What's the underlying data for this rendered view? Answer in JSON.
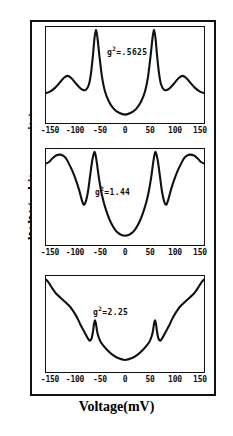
{
  "figure": {
    "ylabel": "dI/dV (arbitrary units)",
    "xlabel": "Voltage(mV)",
    "line_color": "#111111",
    "background_color": "#ffffff"
  },
  "chart_data": {
    "type": "line",
    "title": "",
    "xlabel": "Voltage(mV)",
    "ylabel": "dI/dV (arbitrary units)",
    "xlim": [
      -160,
      160
    ],
    "xticks": [
      -150,
      -100,
      -50,
      0,
      50,
      100,
      150
    ],
    "xticklabels": [
      "-150",
      "-100",
      "-50",
      "0",
      "50",
      "100",
      "150"
    ],
    "yticks": [],
    "yticklabels": [],
    "grid": false,
    "legend": null,
    "panel_layout": "3 stacked panels sharing x axis",
    "panels": [
      {
        "index": 0,
        "annotation": "g2 = .5625",
        "annotation_symbol": "g",
        "annotation_exponent": "2",
        "annotation_value": ".5625",
        "description": "two tall sharp peaks at about -60 and +60 mV reaching the top of the panel, small broad shoulders near -115 and +115 mV, deep flat-bottomed valley centered at 0 mV",
        "x": [
          -160,
          -150,
          -140,
          -130,
          -122,
          -115,
          -108,
          -100,
          -92,
          -85,
          -78,
          -72,
          -68,
          -64,
          -61,
          -58,
          -55,
          -51,
          -46,
          -40,
          -32,
          -22,
          -12,
          0,
          12,
          22,
          32,
          40,
          46,
          51,
          55,
          58,
          61,
          64,
          68,
          72,
          78,
          85,
          92,
          100,
          108,
          115,
          122,
          130,
          140,
          150,
          160
        ],
        "y": [
          0.3,
          0.32,
          0.36,
          0.42,
          0.47,
          0.49,
          0.47,
          0.42,
          0.37,
          0.34,
          0.34,
          0.4,
          0.52,
          0.72,
          0.9,
          0.99,
          0.9,
          0.7,
          0.48,
          0.32,
          0.21,
          0.13,
          0.09,
          0.07,
          0.09,
          0.13,
          0.21,
          0.32,
          0.48,
          0.7,
          0.9,
          0.99,
          0.9,
          0.72,
          0.52,
          0.4,
          0.34,
          0.34,
          0.37,
          0.42,
          0.47,
          0.49,
          0.47,
          0.42,
          0.36,
          0.32,
          0.3
        ]
      },
      {
        "index": 1,
        "annotation": "g2 = 1.44",
        "annotation_symbol": "g",
        "annotation_exponent": "2",
        "annotation_value": "1.44",
        "description": "sharp peaks at about -60 and +60 mV reaching the panel top, pronounced dips near -82 and +82 mV, broad rounded maxima near -120 and +120 mV, wide parabolic valley centered at 0 mV",
        "x": [
          -160,
          -152,
          -145,
          -138,
          -130,
          -124,
          -118,
          -112,
          -105,
          -98,
          -92,
          -87,
          -83,
          -79,
          -74,
          -70,
          -66,
          -63,
          -61,
          -59,
          -56,
          -52,
          -46,
          -38,
          -28,
          -16,
          0,
          16,
          28,
          38,
          46,
          52,
          56,
          59,
          61,
          63,
          66,
          70,
          74,
          79,
          83,
          87,
          92,
          98,
          105,
          112,
          118,
          124,
          130,
          138,
          145,
          152,
          160
        ],
        "y": [
          0.86,
          0.88,
          0.92,
          0.95,
          0.96,
          0.95,
          0.92,
          0.86,
          0.78,
          0.68,
          0.58,
          0.48,
          0.42,
          0.44,
          0.56,
          0.72,
          0.88,
          0.96,
          0.99,
          0.96,
          0.86,
          0.7,
          0.52,
          0.36,
          0.22,
          0.12,
          0.08,
          0.12,
          0.22,
          0.36,
          0.52,
          0.7,
          0.86,
          0.96,
          0.99,
          0.96,
          0.88,
          0.72,
          0.56,
          0.44,
          0.42,
          0.48,
          0.58,
          0.68,
          0.78,
          0.86,
          0.92,
          0.95,
          0.96,
          0.95,
          0.92,
          0.88,
          0.86
        ]
      },
      {
        "index": 2,
        "annotation": "g2 = 2.25",
        "annotation_symbol": "g",
        "annotation_exponent": "2",
        "annotation_value": "2.25",
        "description": "broad V shaped curve rising steeply to the panel top at both edges, small narrow spikes at about -60 and +60 mV on the descending flanks, shallow rounded minimum at 0 mV",
        "x": [
          -160,
          -154,
          -148,
          -142,
          -136,
          -130,
          -124,
          -118,
          -112,
          -106,
          -100,
          -94,
          -88,
          -82,
          -76,
          -71,
          -67,
          -64,
          -62,
          -60,
          -58,
          -55,
          -50,
          -44,
          -36,
          -26,
          -14,
          0,
          14,
          26,
          36,
          44,
          50,
          55,
          58,
          60,
          62,
          64,
          67,
          71,
          76,
          82,
          88,
          94,
          100,
          106,
          112,
          118,
          124,
          130,
          136,
          142,
          148,
          154,
          160
        ],
        "y": [
          0.99,
          0.96,
          0.91,
          0.86,
          0.82,
          0.79,
          0.76,
          0.73,
          0.7,
          0.66,
          0.61,
          0.55,
          0.48,
          0.42,
          0.36,
          0.32,
          0.34,
          0.42,
          0.5,
          0.54,
          0.5,
          0.4,
          0.32,
          0.27,
          0.22,
          0.17,
          0.13,
          0.11,
          0.13,
          0.17,
          0.22,
          0.27,
          0.32,
          0.4,
          0.5,
          0.54,
          0.5,
          0.42,
          0.34,
          0.32,
          0.36,
          0.42,
          0.48,
          0.55,
          0.61,
          0.66,
          0.7,
          0.73,
          0.76,
          0.79,
          0.82,
          0.86,
          0.91,
          0.96,
          0.99
        ]
      }
    ]
  }
}
